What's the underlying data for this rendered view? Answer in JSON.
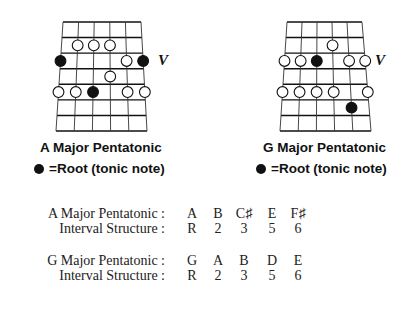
{
  "diagrams": [
    {
      "id": "a-major",
      "title": "A Major Pentatonic",
      "legend": "=Root (tonic note)",
      "position_marker": "V",
      "strings": 6,
      "fret_spaces": 7,
      "geometry": {
        "top_y": 22,
        "bottom_y": 131,
        "top_x": [
          63,
          141
        ],
        "bottom_x": [
          56,
          147
        ]
      },
      "dots": [
        {
          "string": 1,
          "fret": 2,
          "root": false
        },
        {
          "string": 2,
          "fret": 2,
          "root": false
        },
        {
          "string": 3,
          "fret": 2,
          "root": false
        },
        {
          "string": 0,
          "fret": 3,
          "root": true
        },
        {
          "string": 4,
          "fret": 3,
          "root": false
        },
        {
          "string": 5,
          "fret": 3,
          "root": true
        },
        {
          "string": 3,
          "fret": 4,
          "root": false
        },
        {
          "string": 0,
          "fret": 5,
          "root": false
        },
        {
          "string": 1,
          "fret": 5,
          "root": false
        },
        {
          "string": 2,
          "fret": 5,
          "root": true
        },
        {
          "string": 4,
          "fret": 5,
          "root": false
        },
        {
          "string": 5,
          "fret": 5,
          "root": false
        }
      ]
    },
    {
      "id": "g-major",
      "title": "G Major Pentatonic",
      "legend": "=Root (tonic note)",
      "position_marker": "V",
      "strings": 6,
      "fret_spaces": 7,
      "geometry": {
        "top_y": 22,
        "bottom_y": 131,
        "top_x": [
          287,
          362
        ],
        "bottom_x": [
          280,
          371
        ]
      },
      "dots": [
        {
          "string": 3,
          "fret": 2,
          "root": false
        },
        {
          "string": 0,
          "fret": 3,
          "root": false
        },
        {
          "string": 1,
          "fret": 3,
          "root": false
        },
        {
          "string": 2,
          "fret": 3,
          "root": true
        },
        {
          "string": 4,
          "fret": 3,
          "root": false
        },
        {
          "string": 5,
          "fret": 3,
          "root": false
        },
        {
          "string": 0,
          "fret": 5,
          "root": false
        },
        {
          "string": 1,
          "fret": 5,
          "root": false
        },
        {
          "string": 2,
          "fret": 5,
          "root": false
        },
        {
          "string": 3,
          "fret": 5,
          "root": false
        },
        {
          "string": 5,
          "fret": 5,
          "root": false
        },
        {
          "string": 4,
          "fret": 6,
          "root": true
        }
      ]
    }
  ],
  "scale_table": [
    {
      "scale_label": "A Major Pentatonic :",
      "notes": [
        "A",
        "B",
        "C♯",
        "E",
        "F♯"
      ],
      "interval_label": "Interval Structure :",
      "intervals": [
        "R",
        "2",
        "3",
        "5",
        "6"
      ]
    },
    {
      "scale_label": "G Major Pentatonic :",
      "notes": [
        "G",
        "A",
        "B",
        "D",
        "E"
      ],
      "interval_label": "Interval Structure :",
      "intervals": [
        "R",
        "2",
        "3",
        "5",
        "6"
      ]
    }
  ],
  "colors": {
    "ink": "#111111",
    "background": "#ffffff"
  }
}
